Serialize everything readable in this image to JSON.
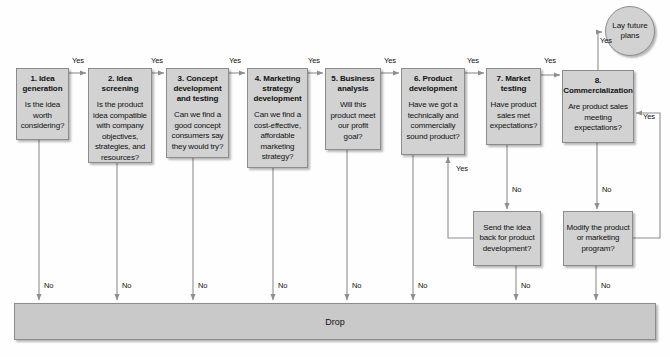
{
  "diagram": {
    "colors": {
      "node_fill": "#d2d2d2",
      "node_border": "#8c8c8c",
      "drop_fill": "#c9c9c9",
      "line": "#8e8e8e",
      "text": "#111111"
    },
    "stages": [
      {
        "id": "idea-generation",
        "title": "1. Idea generation",
        "question": "Is the idea worth considering?",
        "x": 16,
        "y": 68,
        "w": 53,
        "h": 72
      },
      {
        "id": "idea-screening",
        "title": "2. Idea screening",
        "question": "Is the product idea compatible with company objectives, strategies, and resources?",
        "x": 88,
        "y": 68,
        "w": 64,
        "h": 95
      },
      {
        "id": "concept-development-and-testing",
        "title": "3. Concept development and testing",
        "question": "Can we find a good concept consumers say they would try?",
        "x": 166,
        "y": 68,
        "w": 63,
        "h": 90
      },
      {
        "id": "marketing-strategy-development",
        "title": "4. Marketing strategy development",
        "question": "Can we find a cost-effective, affordable marketing strategy?",
        "x": 247,
        "y": 68,
        "w": 61,
        "h": 100
      },
      {
        "id": "business-analysis",
        "title": "5. Business analysis",
        "question": "Will this product meet our profit goal?",
        "x": 325,
        "y": 68,
        "w": 56,
        "h": 82
      },
      {
        "id": "product-development",
        "title": "6. Product development",
        "question": "Have we got a technically and commercially sound product?",
        "x": 401,
        "y": 68,
        "w": 64,
        "h": 87
      },
      {
        "id": "market-testing",
        "title": "7. Market testing",
        "question": "Have product sales met expectations?",
        "x": 486,
        "y": 68,
        "w": 55,
        "h": 77
      },
      {
        "id": "commercialization",
        "title": "8. Commercialization",
        "question": "Are product sales meeting expectations?",
        "x": 562,
        "y": 70,
        "w": 72,
        "h": 73
      }
    ],
    "rework_boxes": [
      {
        "id": "send-idea-back",
        "text": "Send the idea back for product development?",
        "x": 473,
        "y": 211,
        "w": 68,
        "h": 55
      },
      {
        "id": "modify-product",
        "text": "Modify the product or marketing program?",
        "x": 563,
        "y": 211,
        "w": 70,
        "h": 55
      }
    ],
    "terminal": {
      "id": "lay-future-plans",
      "text": "Lay future plans",
      "x": 605,
      "y": 6,
      "w": 50,
      "h": 50
    },
    "drop": {
      "label": "Drop",
      "x": 14,
      "y": 303,
      "w": 642,
      "h": 37
    },
    "yes_label": "Yes",
    "no_label": "No",
    "yes_labels_top": [
      {
        "text": "Yes",
        "x": 72,
        "y": 56
      },
      {
        "text": "Yes",
        "x": 151,
        "y": 56
      },
      {
        "text": "Yes",
        "x": 229,
        "y": 56
      },
      {
        "text": "Yes",
        "x": 308,
        "y": 56
      },
      {
        "text": "Yes",
        "x": 384,
        "y": 56
      },
      {
        "text": "Yes",
        "x": 467,
        "y": 56
      },
      {
        "text": "Yes",
        "x": 544,
        "y": 56
      }
    ],
    "yes_labels_other": [
      {
        "text": "Yes",
        "x": 600,
        "y": 36
      },
      {
        "text": "Yes",
        "x": 456,
        "y": 164
      },
      {
        "text": "Yes",
        "x": 643,
        "y": 112
      }
    ],
    "no_labels": [
      {
        "text": "No",
        "x": 44,
        "y": 281
      },
      {
        "text": "No",
        "x": 122,
        "y": 281
      },
      {
        "text": "No",
        "x": 198,
        "y": 281
      },
      {
        "text": "No",
        "x": 278,
        "y": 281
      },
      {
        "text": "No",
        "x": 352,
        "y": 281
      },
      {
        "text": "No",
        "x": 418,
        "y": 281
      },
      {
        "text": "No",
        "x": 521,
        "y": 281
      },
      {
        "text": "No",
        "x": 601,
        "y": 281
      },
      {
        "text": "No",
        "x": 512,
        "y": 185
      },
      {
        "text": "No",
        "x": 602,
        "y": 185
      }
    ]
  }
}
